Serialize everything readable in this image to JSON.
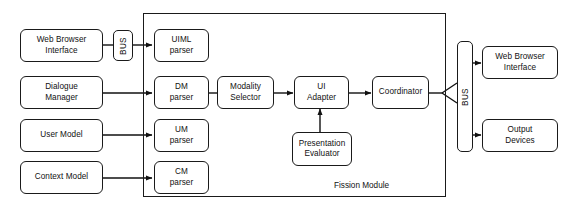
{
  "diagram": {
    "background_color": "#ffffff",
    "stroke_color": "#1a1a1a",
    "text_color": "#111111"
  },
  "inputs": {
    "web_browser_interface": {
      "line1": "Web Browser",
      "line2": "Interface"
    },
    "dialogue_manager": {
      "line1": "Dialogue",
      "line2": "Manager"
    },
    "user_model": {
      "line1": "User Model",
      "line2": ""
    },
    "context_model": {
      "line1": "Context Model",
      "line2": ""
    }
  },
  "bus_left": {
    "label": "BUS"
  },
  "bus_right": {
    "label": "BUS"
  },
  "fission_module": {
    "label": "Fission Module",
    "parsers": [
      {
        "line1": "UIML",
        "line2": "parser"
      },
      {
        "line1": "DM",
        "line2": "parser"
      },
      {
        "line1": "UM",
        "line2": "parser"
      },
      {
        "line1": "CM",
        "line2": "parser"
      }
    ],
    "modality_selector": {
      "line1": "Modality",
      "line2": "Selector"
    },
    "ui_adapter": {
      "line1": "UI",
      "line2": "Adapter"
    },
    "presentation_evaluator": {
      "line1": "Presentation",
      "line2": "Evaluator"
    },
    "coordinator": {
      "line1": "Coordinator",
      "line2": ""
    }
  },
  "outputs": {
    "web_browser_interface": {
      "line1": "Web Browser",
      "line2": "Interface"
    },
    "output_devices": {
      "line1": "Output",
      "line2": "Devices"
    }
  }
}
